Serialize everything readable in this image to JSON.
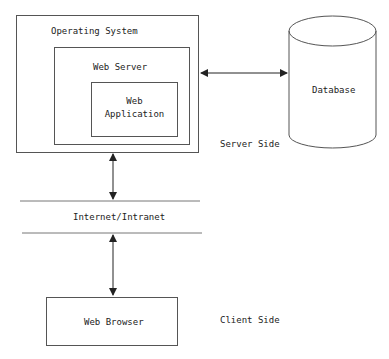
{
  "diagram": {
    "os_label": "Operating System",
    "web_server_label": "Web Server",
    "web_app_label_line1": "Web",
    "web_app_label_line2": "Application",
    "database_label": "Database",
    "server_side_label": "Server Side",
    "network_label": "Internet/Intranet",
    "browser_label": "Web Browser",
    "client_side_label": "Client Side"
  },
  "colors": {
    "line": "#555555",
    "text": "#222222",
    "background": "#ffffff"
  }
}
